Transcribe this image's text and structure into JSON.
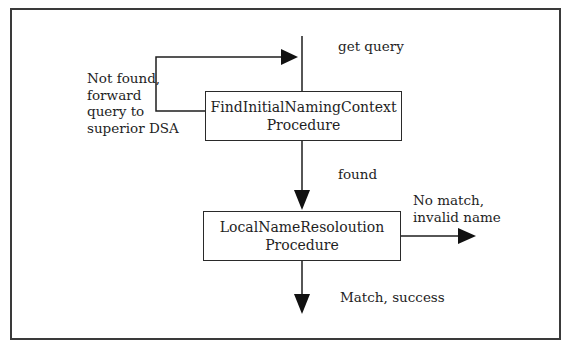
{
  "diagram": {
    "type": "flowchart",
    "nodes": [
      {
        "id": "find",
        "line1": "FindInitialNamingContext",
        "line2": "Procedure"
      },
      {
        "id": "local",
        "line1": "LocalNameResoloution",
        "line2": "Procedure"
      }
    ],
    "labels": {
      "get_query": "get query",
      "not_found": [
        "Not found,",
        "forward",
        "query to",
        "superior DSA"
      ],
      "found": "found",
      "no_match": [
        "No match,",
        "invalid name"
      ],
      "match": "Match, success"
    },
    "edges": [
      {
        "from": "input",
        "to": "find",
        "label": "get query"
      },
      {
        "from": "find",
        "to": "find",
        "label": "Not found, forward query to superior DSA"
      },
      {
        "from": "find",
        "to": "local",
        "label": "found"
      },
      {
        "from": "local",
        "to": "output-fail",
        "label": "No match, invalid name"
      },
      {
        "from": "local",
        "to": "output-success",
        "label": "Match, success"
      }
    ],
    "colors": {
      "line": "#1e1e1e",
      "frame": "#3a3a3a",
      "background": "#ffffff"
    }
  }
}
